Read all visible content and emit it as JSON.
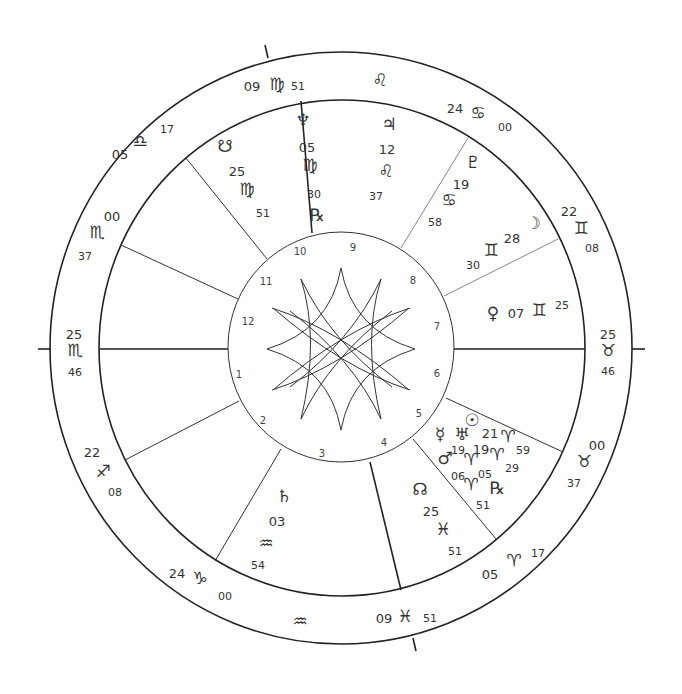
{
  "chart_type": "natal wheel",
  "colors": {
    "line": "#222222",
    "text": "#333333",
    "background": "#ffffff"
  },
  "angles": {
    "ascendant": {
      "deg": "25",
      "sign": "♏",
      "sign_name": "scorpio",
      "min": "46"
    },
    "descendant": {
      "deg": "25",
      "sign": "♉",
      "sign_name": "taurus",
      "min": "46"
    },
    "mc": {
      "deg": "09",
      "sign": "♍",
      "sign_name": "virgo",
      "min": "51"
    },
    "ic": {
      "deg": "09",
      "sign": "♓",
      "sign_name": "pisces",
      "min": "51"
    }
  },
  "cusps": [
    {
      "house": 11,
      "deg": "05",
      "sign": "♎",
      "sign_name": "libra",
      "min": "17"
    },
    {
      "house": 12,
      "deg": "00",
      "sign": "♏",
      "sign_name": "scorpio",
      "min": "37"
    },
    {
      "house": 2,
      "deg": "22",
      "sign": "♐",
      "sign_name": "sagittarius",
      "min": "08"
    },
    {
      "house": 3,
      "deg": "24",
      "sign": "♑",
      "sign_name": "capricorn",
      "min": "00"
    },
    {
      "house": 5,
      "deg": "05",
      "sign": "♈",
      "sign_name": "aries",
      "min": "17"
    },
    {
      "house": 6,
      "deg": "00",
      "sign": "♉",
      "sign_name": "taurus",
      "min": "37"
    },
    {
      "house": 8,
      "deg": "22",
      "sign": "♊",
      "sign_name": "gemini",
      "min": "08"
    },
    {
      "house": 9,
      "deg": "24",
      "sign": "♋",
      "sign_name": "cancer",
      "min": "00"
    }
  ],
  "intercepted_signs": [
    {
      "sign": "♌",
      "sign_name": "leo"
    },
    {
      "sign": "♒",
      "sign_name": "aquarius"
    }
  ],
  "planets": [
    {
      "name": "south-node",
      "glyph": "☋",
      "deg": "25",
      "sign": "♍",
      "min": "51",
      "retro": ""
    },
    {
      "name": "neptune",
      "glyph": "♆",
      "deg": "05",
      "sign": "♍",
      "min": "30",
      "retro": "℞"
    },
    {
      "name": "jupiter",
      "glyph": "♃",
      "deg": "12",
      "sign": "♌",
      "min": "37",
      "retro": ""
    },
    {
      "name": "pluto",
      "glyph": "♇",
      "deg": "19",
      "sign": "♋",
      "min": "58",
      "retro": ""
    },
    {
      "name": "moon",
      "glyph": "☽",
      "deg": "28",
      "sign": "♊",
      "min": "30",
      "retro": ""
    },
    {
      "name": "venus",
      "glyph": "♀",
      "deg": "07",
      "sign": "♊",
      "min": "25",
      "retro": ""
    },
    {
      "name": "sun",
      "glyph": "☉",
      "deg": "21",
      "sign": "♈",
      "min": "59",
      "retro": ""
    },
    {
      "name": "uranus",
      "glyph": "♅",
      "deg": "19",
      "sign": "♈",
      "min": "29",
      "retro": ""
    },
    {
      "name": "mercury",
      "glyph": "☿",
      "deg": "05",
      "sign": "",
      "min": "",
      "retro": "℞"
    },
    {
      "name": "mars",
      "glyph": "♂",
      "deg": "19",
      "sign": "♈",
      "min": "",
      "retro": ""
    },
    {
      "name": "mercury-pos",
      "glyph": "",
      "deg": "06",
      "sign": "♈",
      "min": "51",
      "retro": ""
    },
    {
      "name": "north-node",
      "glyph": "☊",
      "deg": "25",
      "sign": "♓",
      "min": "51",
      "retro": ""
    },
    {
      "name": "saturn",
      "glyph": "♄",
      "deg": "03",
      "sign": "♒",
      "min": "54",
      "retro": ""
    }
  ],
  "house_numbers": [
    "1",
    "2",
    "3",
    "4",
    "5",
    "6",
    "7",
    "8",
    "9",
    "10",
    "11",
    "12"
  ]
}
